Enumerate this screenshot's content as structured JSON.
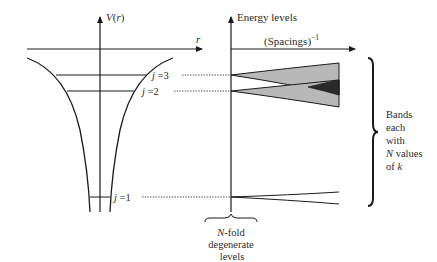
{
  "left_panel": {
    "y_axis_label": "V(r)",
    "x_axis_label": "r",
    "levels": [
      {
        "label": "j =3"
      },
      {
        "label": "j =2"
      },
      {
        "label": "j =1"
      }
    ]
  },
  "right_panel": {
    "y_axis_label": "Energy levels",
    "x_axis_label": "(Spacings)",
    "x_axis_exponent": "−1",
    "bottom_label": [
      "N-fold",
      "degenerate",
      "levels"
    ],
    "brace_label": [
      "Bands",
      "each",
      "with",
      "N values",
      "of k"
    ]
  },
  "colors": {
    "line": "#1a1a1a",
    "band_fill": "#b8b8b8",
    "overlap_fill": "#2a2a2a"
  }
}
